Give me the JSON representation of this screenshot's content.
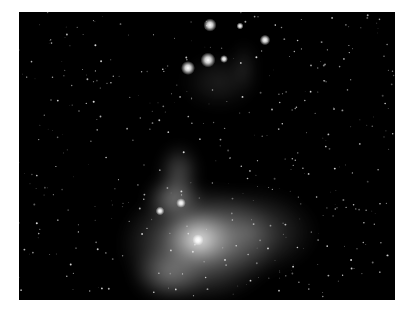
{
  "image": {
    "subject": "Orion Nebula star field",
    "background_color": "#000000",
    "page_background": "#ffffff",
    "bright_stars": [
      {
        "x": 191,
        "y": 13,
        "r": 3.0
      },
      {
        "x": 169,
        "y": 56,
        "r": 3.2
      },
      {
        "x": 189,
        "y": 48,
        "r": 3.4
      },
      {
        "x": 246,
        "y": 28,
        "r": 2.4
      },
      {
        "x": 205,
        "y": 47,
        "r": 1.8
      },
      {
        "x": 221,
        "y": 14,
        "r": 1.6
      },
      {
        "x": 141,
        "y": 199,
        "r": 2.0
      },
      {
        "x": 179,
        "y": 228,
        "r": 2.6
      },
      {
        "x": 162,
        "y": 191,
        "r": 2.2
      }
    ],
    "nebula_clouds": [
      {
        "cx": 180,
        "cy": 232,
        "rx": 80,
        "ry": 60,
        "opacity": 0.55
      },
      {
        "cx": 180,
        "cy": 226,
        "rx": 38,
        "ry": 30,
        "opacity": 0.75
      },
      {
        "cx": 180,
        "cy": 228,
        "rx": 16,
        "ry": 14,
        "opacity": 0.95
      },
      {
        "cx": 155,
        "cy": 186,
        "rx": 30,
        "ry": 24,
        "opacity": 0.45
      },
      {
        "cx": 160,
        "cy": 160,
        "rx": 22,
        "ry": 30,
        "opacity": 0.3
      },
      {
        "cx": 230,
        "cy": 220,
        "rx": 70,
        "ry": 45,
        "opacity": 0.3
      },
      {
        "cx": 150,
        "cy": 262,
        "rx": 40,
        "ry": 30,
        "opacity": 0.35
      },
      {
        "cx": 200,
        "cy": 70,
        "rx": 40,
        "ry": 30,
        "opacity": 0.12
      },
      {
        "cx": 225,
        "cy": 55,
        "rx": 14,
        "ry": 28,
        "opacity": 0.12
      }
    ]
  }
}
